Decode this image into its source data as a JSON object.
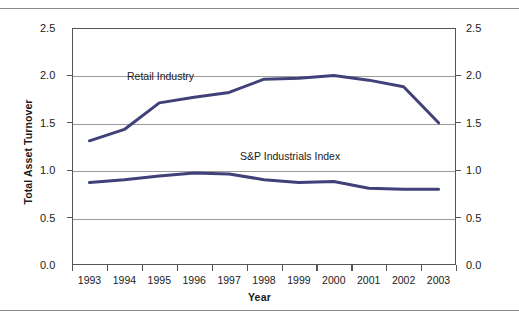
{
  "figure": {
    "y_axis_title": "Total Asset Turnover",
    "x_axis_title": "Year"
  },
  "annotations": {
    "retail": "Retail Industry",
    "sp": "S&P Industrials Index"
  },
  "axis": {
    "y_ticks": [
      "0.0",
      "0.5",
      "1.0",
      "1.5",
      "2.0",
      "2.5"
    ],
    "y_ticks_right": [
      "0.0",
      "0.5",
      "1.0",
      "1.5",
      "2.0",
      "2.5"
    ],
    "x_ticks": [
      "1993",
      "1994",
      "1995",
      "1996",
      "1997",
      "1998",
      "1999",
      "2000",
      "2001",
      "2002",
      "2003"
    ]
  },
  "colors": {
    "series_line": "#41417a",
    "gridline": "#9a9a9a",
    "axis": "#555555",
    "rule": "#8a8a8a",
    "text": "#1a1a1a"
  },
  "chart_data": {
    "type": "line",
    "title": "",
    "subtitle": "",
    "xlabel": "Year",
    "ylabel": "Total Asset Turnover",
    "x": [
      "1993",
      "1994",
      "1995",
      "1996",
      "1997",
      "1998",
      "1999",
      "2000",
      "2001",
      "2002",
      "2003"
    ],
    "ylim": [
      0.0,
      2.5
    ],
    "yticks": [
      0.0,
      0.5,
      1.0,
      1.5,
      2.0,
      2.5
    ],
    "grid": true,
    "legend": "inline-annotations",
    "series": [
      {
        "name": "Retail Industry",
        "values": [
          1.31,
          1.43,
          1.71,
          1.77,
          1.82,
          1.96,
          1.97,
          2.0,
          1.95,
          1.88,
          1.5
        ]
      },
      {
        "name": "S&P Industrials Index",
        "values": [
          0.87,
          0.9,
          0.94,
          0.97,
          0.96,
          0.9,
          0.87,
          0.88,
          0.81,
          0.8,
          0.8
        ]
      }
    ]
  }
}
